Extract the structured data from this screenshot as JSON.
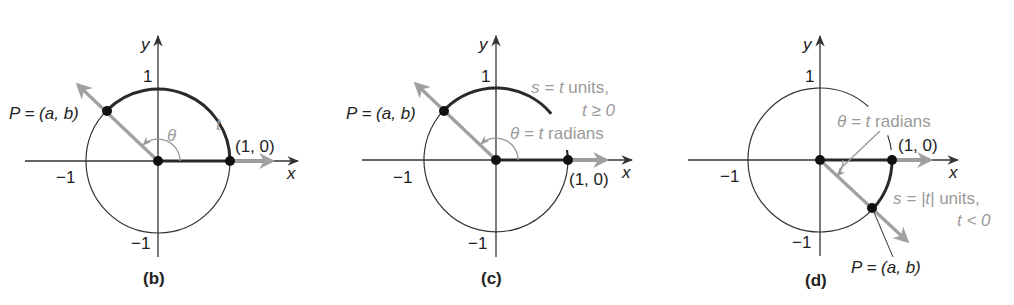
{
  "figure": {
    "panels": [
      {
        "id": "b",
        "caption": "(b)",
        "axis_x": "x",
        "axis_y": "y",
        "tick_y_pos": "1",
        "tick_y_neg": "−1",
        "tick_x_neg": "−1",
        "point_p": "P = (a, b)",
        "point_p_eq": "P = ",
        "point_p_coords": "(a, b)",
        "point_10": "(1, 0)",
        "arc_label": "t",
        "angle_label": "θ"
      },
      {
        "id": "c",
        "caption": "(c)",
        "axis_x": "x",
        "axis_y": "y",
        "tick_y_pos": "1",
        "tick_y_neg": "−1",
        "tick_x_neg": "−1",
        "point_p_eq": "P = ",
        "point_p_coords": "(a, b)",
        "point_10": "(1, 0)",
        "arc_label_line1_s": "s = ",
        "arc_label_line1_t": "t",
        "arc_label_line1_rest": " units,",
        "arc_label_line2": "t ≥ 0",
        "angle_label_theta": "θ = ",
        "angle_label_t": "t",
        "angle_label_rest": " radians"
      },
      {
        "id": "d",
        "caption": "(d)",
        "axis_x": "x",
        "axis_y": "y",
        "tick_y_pos": "1",
        "tick_y_neg": "−1",
        "tick_x_neg": "−1",
        "point_p_eq": "P = ",
        "point_p_coords": "(a, b)",
        "point_10": "(1, 0)",
        "angle_label_theta": "θ = ",
        "angle_label_t": "t",
        "angle_label_rest": " radians",
        "arc_label_line1_s": "s = ",
        "arc_label_line1_abs": "|t|",
        "arc_label_line1_rest": " units,",
        "arc_label_line2": "t < 0"
      }
    ],
    "colors": {
      "ink": "#222222",
      "highlight_gray": "#9a9a9a",
      "ray_gray": "#a0a0a0"
    }
  }
}
